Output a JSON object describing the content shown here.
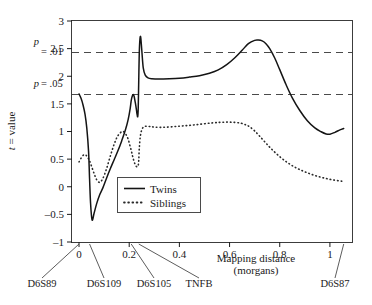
{
  "chart_data": {
    "type": "line",
    "title": "",
    "xlabel": "Mapping distance (morgans)",
    "ylabel": "t = value",
    "xlim": [
      -0.028,
      1.088
    ],
    "ylim": [
      -1,
      3
    ],
    "xticks": [
      0,
      0.2,
      0.4,
      0.6,
      0.8,
      1
    ],
    "xtick_labels": [
      "0",
      "0.2",
      "0.4",
      "0.6",
      "0.8",
      "1"
    ],
    "yticks": [
      -1,
      -0.5,
      0,
      0.5,
      1,
      1.5,
      2,
      2.5,
      3
    ],
    "ytick_labels": [
      "–1",
      "–0.5",
      "0",
      "0.5",
      "1",
      "1.5",
      "2",
      "2.5",
      "3"
    ],
    "grid": false,
    "legend_position": "center",
    "annotations": [
      {
        "name": "p = .01",
        "label_line1": "p",
        "label_line2": "= .01",
        "y": 2.43
      },
      {
        "name": "p = .05",
        "label_line1": "p",
        "label_line2": "= .05",
        "y": 1.67
      }
    ],
    "markers": [
      {
        "label": "D6S89",
        "x": 0.0
      },
      {
        "label": "D6S109",
        "x": 0.042
      },
      {
        "label": "D6S105",
        "x": 0.208
      },
      {
        "label": "TNFB",
        "x": 0.238
      },
      {
        "label": "D6S87",
        "x": 1.055
      }
    ],
    "series": [
      {
        "name": "Twins",
        "style": "solid",
        "x": [
          0.0,
          0.008,
          0.016,
          0.024,
          0.031,
          0.038,
          0.042,
          0.046,
          0.052,
          0.06,
          0.07,
          0.082,
          0.095,
          0.11,
          0.125,
          0.14,
          0.155,
          0.17,
          0.185,
          0.196,
          0.204,
          0.208,
          0.212,
          0.216,
          0.22,
          0.224,
          0.228,
          0.231,
          0.234,
          0.236,
          0.238,
          0.24,
          0.243,
          0.246,
          0.25,
          0.256,
          0.264,
          0.275,
          0.29,
          0.32,
          0.36,
          0.4,
          0.44,
          0.48,
          0.52,
          0.555,
          0.59,
          0.62,
          0.65,
          0.675,
          0.7,
          0.715,
          0.73,
          0.745,
          0.76,
          0.78,
          0.8,
          0.825,
          0.85,
          0.88,
          0.91,
          0.94,
          0.965,
          0.985,
          1.0,
          1.02,
          1.04,
          1.055
        ],
        "y": [
          1.68,
          1.6,
          1.48,
          1.31,
          1.06,
          0.64,
          0.15,
          -0.3,
          -0.6,
          -0.48,
          -0.31,
          -0.15,
          -0.02,
          0.16,
          0.33,
          0.49,
          0.65,
          0.83,
          1.03,
          1.22,
          1.42,
          1.56,
          1.64,
          1.67,
          1.63,
          1.53,
          1.42,
          1.32,
          1.27,
          1.43,
          1.92,
          2.4,
          2.68,
          2.7,
          2.48,
          2.15,
          2.02,
          1.97,
          1.955,
          1.95,
          1.955,
          1.965,
          1.985,
          2.01,
          2.055,
          2.115,
          2.215,
          2.33,
          2.47,
          2.59,
          2.65,
          2.655,
          2.64,
          2.59,
          2.5,
          2.33,
          2.12,
          1.85,
          1.61,
          1.38,
          1.195,
          1.065,
          0.995,
          0.955,
          0.95,
          0.985,
          1.03,
          1.055
        ]
      },
      {
        "name": "Siblings",
        "style": "dotted",
        "x": [
          0.0,
          0.006,
          0.012,
          0.02,
          0.028,
          0.036,
          0.042,
          0.05,
          0.06,
          0.07,
          0.082,
          0.095,
          0.11,
          0.125,
          0.14,
          0.152,
          0.163,
          0.172,
          0.18,
          0.188,
          0.196,
          0.202,
          0.208,
          0.212,
          0.216,
          0.22,
          0.224,
          0.228,
          0.232,
          0.236,
          0.238,
          0.24,
          0.244,
          0.25,
          0.258,
          0.268,
          0.282,
          0.3,
          0.33,
          0.37,
          0.41,
          0.45,
          0.49,
          0.53,
          0.56,
          0.59,
          0.62,
          0.645,
          0.665,
          0.68,
          0.7,
          0.72,
          0.745,
          0.77,
          0.8,
          0.83,
          0.86,
          0.89,
          0.92,
          0.95,
          0.98,
          1.01,
          1.04,
          1.055
        ],
        "y": [
          0.45,
          0.5,
          0.545,
          0.58,
          0.57,
          0.52,
          0.47,
          0.37,
          0.24,
          0.13,
          0.08,
          0.15,
          0.33,
          0.56,
          0.77,
          0.9,
          0.97,
          1.0,
          0.99,
          0.94,
          0.86,
          0.76,
          0.66,
          0.58,
          0.51,
          0.45,
          0.4,
          0.37,
          0.36,
          0.39,
          0.48,
          0.68,
          0.9,
          1.03,
          1.085,
          1.095,
          1.09,
          1.08,
          1.075,
          1.085,
          1.1,
          1.115,
          1.135,
          1.155,
          1.165,
          1.17,
          1.165,
          1.15,
          1.12,
          1.085,
          1.01,
          0.915,
          0.79,
          0.67,
          0.545,
          0.44,
          0.355,
          0.29,
          0.235,
          0.19,
          0.155,
          0.125,
          0.105,
          0.095
        ]
      }
    ]
  },
  "legend": {
    "items": [
      {
        "label": "Twins",
        "style": "solid"
      },
      {
        "label": "Siblings",
        "style": "dotted"
      }
    ]
  },
  "axis": {
    "y_title_var": "t",
    "y_title_rest": " = value",
    "x_title_line1": "Mapping distance",
    "x_title_line2": "(morgans)"
  }
}
